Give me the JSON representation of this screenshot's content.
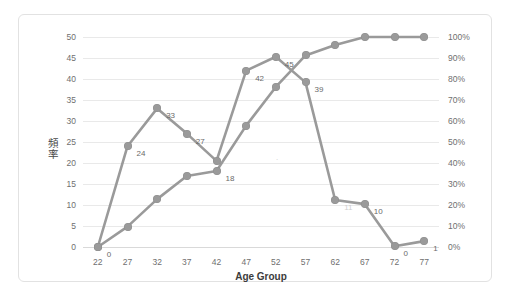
{
  "chart_data": {
    "type": "line",
    "title": "",
    "xlabel": "Age Group",
    "ylabel": "頻率",
    "ylabel_right": "",
    "categories": [
      "22",
      "27",
      "32",
      "37",
      "42",
      "47",
      "52",
      "57",
      "62",
      "67",
      "72",
      "77"
    ],
    "ylim": [
      0,
      50
    ],
    "yticks": [
      "0",
      "5",
      "10",
      "15",
      "20",
      "25",
      "30",
      "35",
      "40",
      "45",
      "50"
    ],
    "ylim_right": [
      0,
      100
    ],
    "yticks_right": [
      "0%",
      "10%",
      "20%",
      "30%",
      "40%",
      "50%",
      "60%",
      "70%",
      "80%",
      "90%",
      "100%"
    ],
    "grid": true,
    "legend": "none",
    "series": [
      {
        "name": "頻率",
        "axis": "left",
        "color": "#9a9a9a",
        "values": [
          0,
          24,
          33,
          27,
          20.5,
          42,
          45.3,
          39.2,
          11.2,
          10.2,
          0.2,
          1.4
        ],
        "labels": [
          "0",
          "24",
          "33",
          "27",
          "",
          "42",
          "45",
          "39",
          "11",
          "10",
          "0",
          "1"
        ],
        "label_faint": [
          false,
          false,
          false,
          false,
          false,
          false,
          false,
          false,
          true,
          false,
          false,
          false
        ]
      },
      {
        "name": "累積百分比",
        "axis": "right",
        "color": "#9a9a9a",
        "values": [
          0,
          9.7,
          22.8,
          33.8,
          36.2,
          57.8,
          76.2,
          91.2,
          96.2,
          100,
          100,
          100
        ],
        "labels": [
          "",
          "",
          "",
          "",
          "18",
          "",
          "",
          "",
          "",
          "",
          "",
          ""
        ],
        "label_faint": [
          false,
          false,
          false,
          false,
          false,
          false,
          false,
          false,
          false,
          false,
          false,
          false
        ]
      }
    ],
    "stray_marks": [
      {
        "x_index": 6.0,
        "value_left": 21.0,
        "text": "·"
      }
    ]
  },
  "colors": {
    "line": "#9a9a9a",
    "marker": "#9a9a9a",
    "grid": "#e9e9e9",
    "tick_text": "#6f6f6f",
    "axis_title": "#3c3c3c",
    "border": "#e2e2e2",
    "background": "#ffffff"
  }
}
